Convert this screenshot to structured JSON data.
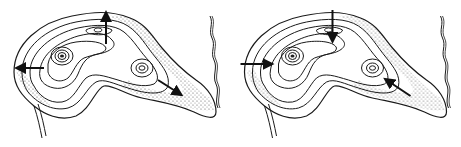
{
  "figure": {
    "type": "contour-diagram",
    "panels": [
      {
        "id": "left",
        "arrow_direction": "outward",
        "arrow_count": 3
      },
      {
        "id": "right",
        "arrow_direction": "inward",
        "arrow_count": 3
      }
    ],
    "colors": {
      "line": "#1a1a1a",
      "stipple": "#555555",
      "background": "#ffffff"
    }
  }
}
